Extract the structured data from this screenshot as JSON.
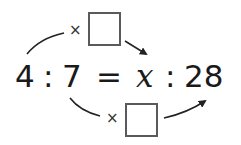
{
  "equation": {
    "left_a": "4",
    "left_sep": ":",
    "left_b": "7",
    "equals": "=",
    "right_a": "x",
    "right_sep": ":",
    "right_b": "28"
  },
  "top_operation": {
    "operator": "×",
    "blank": ""
  },
  "bottom_operation": {
    "operator": "×",
    "blank": ""
  },
  "colors": {
    "text": "#1a1a1a",
    "box_border": "#5a5a5a",
    "arrow": "#222222"
  }
}
